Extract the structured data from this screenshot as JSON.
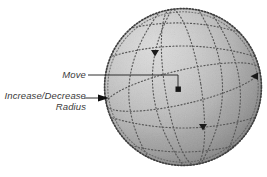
{
  "figure": {
    "type": "technical-illustration",
    "background_color": "#ffffff",
    "canvas": {
      "width": 267,
      "height": 177
    }
  },
  "sphere": {
    "name": "sphere-object",
    "center_x": 183,
    "center_y": 87,
    "radius_x": 79,
    "radius_y": 79,
    "fill_light": "#cfcfcf",
    "fill_mid": "#a9a9a9",
    "fill_dark": "#6f6f6f",
    "rim_color": "#4a4a4a",
    "grid_color": "#585858",
    "grid_dot_style": "dotted"
  },
  "callouts": [
    {
      "id": "move",
      "label": "Move",
      "label_lines": [
        "Move"
      ],
      "label_x": 86,
      "label_y": 75,
      "leader_from_x": 88,
      "leader_from_y": 75,
      "leader_elbow_x": 178,
      "target_x": 178,
      "target_y": 89,
      "handle_shape": "square",
      "handle_color": "#1c1c1c"
    },
    {
      "id": "radius",
      "label": "Increase/Decrease Radius",
      "label_lines": [
        "Increase/Decrease",
        "Radius"
      ],
      "label_x": 86,
      "label_y": 96,
      "leader_from_x": 88,
      "leader_from_y": 98,
      "target_x": 107,
      "target_y": 98,
      "handle_shape": "arrow-right",
      "handle_color": "#101010"
    }
  ],
  "handles": [
    {
      "id": "handle-top",
      "name": "grid-handle-top",
      "shape": "triangle-down",
      "x": 155,
      "y": 53,
      "size": 6,
      "color": "#1a1a1a"
    },
    {
      "id": "handle-right",
      "name": "grid-handle-right",
      "shape": "triangle-left",
      "x": 254,
      "y": 76,
      "size": 6,
      "color": "#1a1a1a"
    },
    {
      "id": "handle-bottom",
      "name": "grid-handle-bottom",
      "shape": "triangle-down",
      "x": 203,
      "y": 127,
      "size": 6,
      "color": "#1a1a1a"
    },
    {
      "id": "handle-center",
      "name": "move-handle-center",
      "shape": "square",
      "x": 178,
      "y": 89,
      "size": 5,
      "color": "#161616"
    }
  ],
  "text_style": {
    "color": "#3a3a3a",
    "italic": true,
    "size_px": 9.5,
    "align": "right"
  },
  "leader_line_color": "#2e2e2e"
}
